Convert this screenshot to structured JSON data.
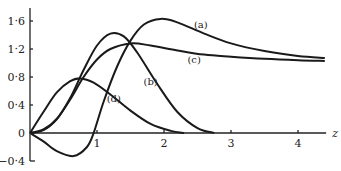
{
  "chart_data": {
    "type": "line",
    "title": "",
    "xlabel": "z",
    "ylabel": "",
    "xlim": [
      0,
      4.4
    ],
    "ylim": [
      -0.4,
      1.75
    ],
    "grid": false,
    "legend": "inline labels",
    "x_ticks": [
      "1",
      "2",
      "3",
      "4"
    ],
    "y_ticks": [
      "1·6",
      "1·2",
      "0·8",
      "0·4",
      "0",
      "−0·4"
    ],
    "series": [
      {
        "name": "(a)",
        "x": [
          0,
          0.2,
          0.4,
          0.65,
          0.85,
          0.95,
          1.1,
          1.3,
          1.5,
          1.7,
          1.95,
          2.2,
          2.6,
          3.0,
          3.5,
          4.0,
          4.4
        ],
        "y": [
          0,
          -0.12,
          -0.26,
          -0.33,
          -0.2,
          0,
          0.45,
          0.95,
          1.32,
          1.55,
          1.63,
          1.58,
          1.42,
          1.28,
          1.17,
          1.1,
          1.07
        ]
      },
      {
        "name": "(b)",
        "x": [
          0,
          0.2,
          0.4,
          0.6,
          0.8,
          1.0,
          1.2,
          1.4,
          1.6,
          1.9,
          2.2,
          2.5,
          2.75
        ],
        "y": [
          0,
          0.05,
          0.2,
          0.5,
          0.9,
          1.25,
          1.42,
          1.38,
          1.15,
          0.7,
          0.3,
          0.07,
          0
        ]
      },
      {
        "name": "(c)",
        "x": [
          0,
          0.2,
          0.4,
          0.6,
          0.8,
          1.0,
          1.2,
          1.5,
          1.8,
          2.2,
          2.6,
          3.0,
          3.5,
          4.0,
          4.4
        ],
        "y": [
          0,
          0.04,
          0.2,
          0.48,
          0.8,
          1.05,
          1.2,
          1.28,
          1.25,
          1.18,
          1.12,
          1.09,
          1.06,
          1.04,
          1.03
        ]
      },
      {
        "name": "(d)",
        "x": [
          0,
          0.2,
          0.4,
          0.6,
          0.75,
          0.95,
          1.2,
          1.5,
          1.8,
          2.1,
          2.3
        ],
        "y": [
          0,
          0.3,
          0.58,
          0.74,
          0.78,
          0.72,
          0.55,
          0.32,
          0.13,
          0.03,
          0
        ]
      }
    ],
    "annotations": [
      {
        "text": "(a)",
        "x": 2.55,
        "y": 1.5
      },
      {
        "text": "(b)",
        "x": 1.8,
        "y": 0.68
      },
      {
        "text": "(c)",
        "x": 2.45,
        "y": 1.0
      },
      {
        "text": "(d)",
        "x": 1.25,
        "y": 0.45
      }
    ]
  }
}
